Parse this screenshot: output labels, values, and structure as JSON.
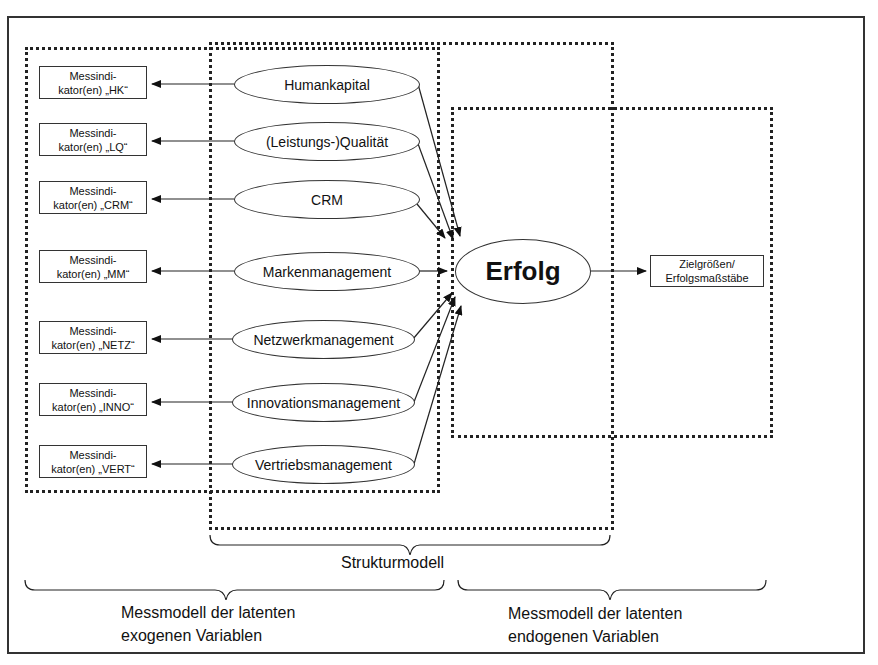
{
  "diagram": {
    "type": "structural-equation-model",
    "indicator_boxes": [
      {
        "line1": "Messindi-",
        "line2": "kator(en) „HK“"
      },
      {
        "line1": "Messindi-",
        "line2": "kator(en) „LQ“"
      },
      {
        "line1": "Messindi-",
        "line2": "kator(en) „CRM“"
      },
      {
        "line1": "Messindi-",
        "line2": "kator(en) „MM“"
      },
      {
        "line1": "Messindi-",
        "line2": "kator(en) „NETZ“"
      },
      {
        "line1": "Messindi-",
        "line2": "kator(en) „INNO“"
      },
      {
        "line1": "Messindi-",
        "line2": "kator(en) „VERT“"
      }
    ],
    "latent_exogenous": [
      "Humankapital",
      "(Leistungs-)Qualität",
      "CRM",
      "Markenmanagement",
      "Netzwerkmanagement",
      "Innovationsmanagement",
      "Vertriebsmanagement"
    ],
    "latent_endogenous": "Erfolg",
    "target_box": {
      "line1": "Zielgrößen/",
      "line2": "Erfolgsmaßstäbe"
    },
    "labels": {
      "structural_model": "Strukturmodell",
      "exogenous_measurement_line1": "Messmodell der latenten",
      "exogenous_measurement_line2": "exogenen Variablen",
      "endogenous_measurement_line1": "Messmodell der latenten",
      "endogenous_measurement_line2": "endogenen Variablen"
    }
  }
}
